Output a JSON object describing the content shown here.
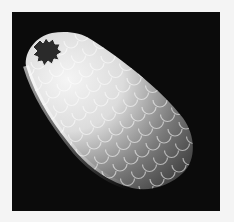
{
  "image": {
    "subject": "scanning electron micrograph of a scaled, flask-shaped testate amoeba shell with toothed aperture",
    "colors": {
      "border": "#f4f4f4",
      "background": "#0b0b0b",
      "shell_highlight": "#f2f2f2",
      "shell_shadow": "#3a3a3a",
      "aperture": "#2a2a2a"
    }
  }
}
